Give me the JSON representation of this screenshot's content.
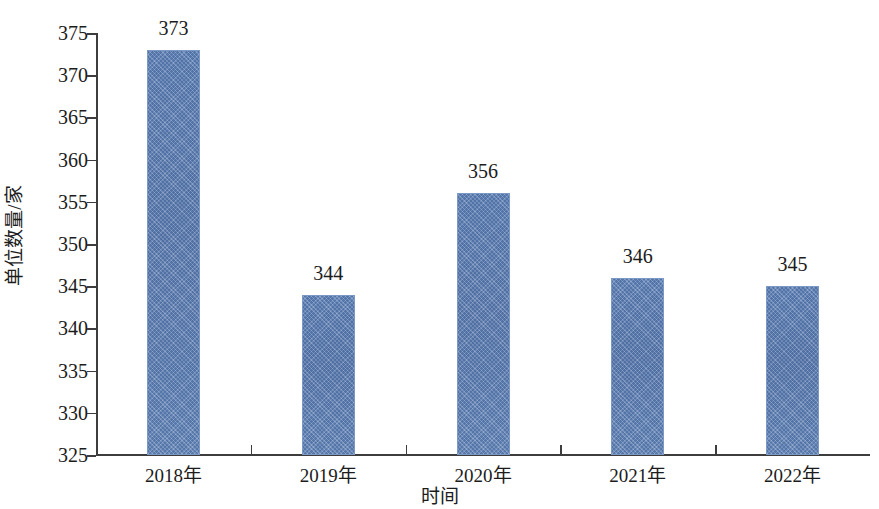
{
  "chart_data": {
    "type": "bar",
    "title": "",
    "subtitle": "",
    "xlabel": "时间",
    "ylabel": "单位数量/家",
    "categories": [
      "2018年",
      "2019年",
      "2020年",
      "2021年",
      "2022年"
    ],
    "values": [
      373,
      344,
      356,
      346,
      345
    ],
    "data_labels": [
      "373",
      "344",
      "356",
      "346",
      "345"
    ],
    "ylim": [
      325,
      375
    ],
    "ytick_labels": [
      "325",
      "330",
      "335",
      "340",
      "345",
      "350",
      "355",
      "360",
      "365",
      "370",
      "375"
    ],
    "ytick_values": [
      325,
      330,
      335,
      340,
      345,
      350,
      355,
      360,
      365,
      370,
      375
    ],
    "ytick_step": 5,
    "grid": false,
    "legend": false,
    "legend_position": "none",
    "bar_color": "#5b7cb1",
    "bar_edge_color": "#7c99c6",
    "axis_color": "#3d3d3d",
    "background_color": "#ffffff",
    "series": [
      {
        "name": "单位数量",
        "values": [
          373,
          344,
          356,
          346,
          345
        ]
      }
    ]
  }
}
